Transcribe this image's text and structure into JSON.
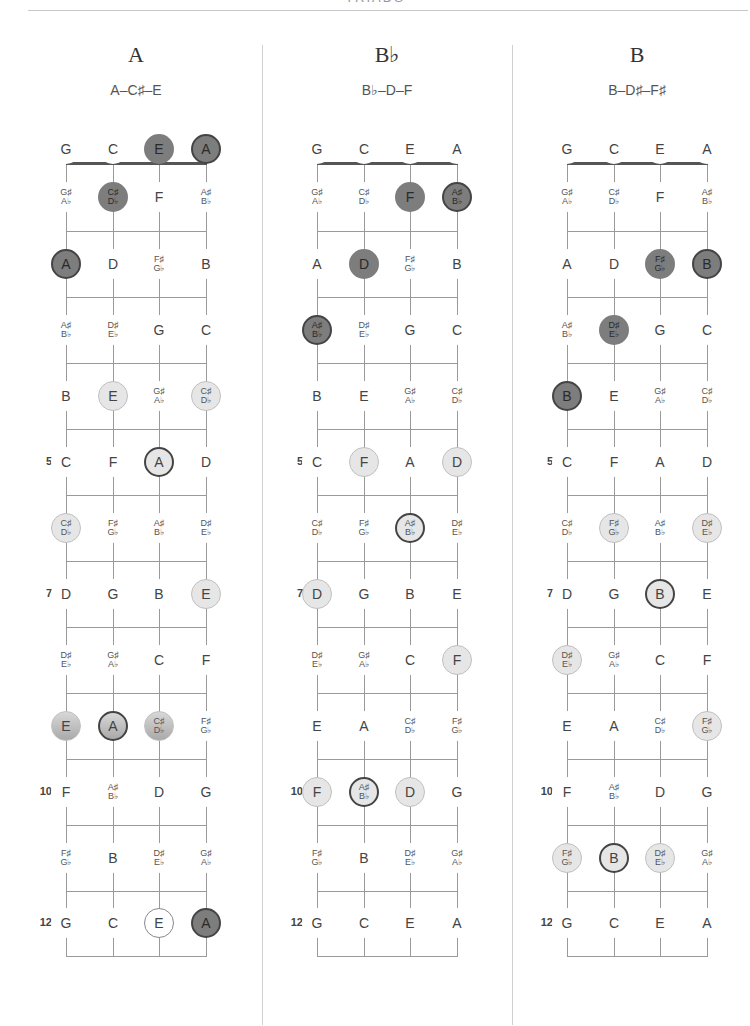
{
  "header": {
    "title": "TRIADS"
  },
  "colors": {
    "dark": "#7d7d7d",
    "mid": "#b8b8b8",
    "light": "#e6e6e6",
    "root_border": "#444444",
    "grid": "#9a9a9a"
  },
  "tuning": [
    "G",
    "C",
    "E",
    "A"
  ],
  "fret_numbers": {
    "5": "5",
    "7": "7",
    "10": "10",
    "12": "12"
  },
  "fretboard_notes": [
    [
      "G",
      "C",
      "E",
      "A"
    ],
    [
      "G♯|A♭",
      "C♯|D♭",
      "F",
      "A♯|B♭"
    ],
    [
      "A",
      "D",
      "F♯|G♭",
      "B"
    ],
    [
      "A♯|B♭",
      "D♯|E♭",
      "G",
      "C"
    ],
    [
      "B",
      "E",
      "G♯|A♭",
      "C♯|D♭"
    ],
    [
      "C",
      "F",
      "A",
      "D"
    ],
    [
      "C♯|D♭",
      "F♯|G♭",
      "A♯|B♭",
      "D♯|E♭"
    ],
    [
      "D",
      "G",
      "B",
      "E"
    ],
    [
      "D♯|E♭",
      "G♯|A♭",
      "C",
      "F"
    ],
    [
      "E",
      "A",
      "C♯|D♭",
      "F♯|G♭"
    ],
    [
      "F",
      "A♯|B♭",
      "D",
      "G"
    ],
    [
      "F♯|G♭",
      "B",
      "D♯|E♭",
      "G♯|A♭"
    ],
    [
      "G",
      "C",
      "E",
      "A"
    ]
  ],
  "chords": [
    {
      "name": "A",
      "notes": "A–C♯–E",
      "highlights": [
        {
          "fret": 0,
          "string": 2,
          "style": "dark",
          "root": false
        },
        {
          "fret": 0,
          "string": 3,
          "style": "dark",
          "root": true
        },
        {
          "fret": 1,
          "string": 1,
          "style": "dark",
          "root": false
        },
        {
          "fret": 2,
          "string": 0,
          "style": "dark",
          "root": true
        },
        {
          "fret": 4,
          "string": 1,
          "style": "light",
          "root": false
        },
        {
          "fret": 4,
          "string": 3,
          "style": "light",
          "root": false
        },
        {
          "fret": 5,
          "string": 2,
          "style": "light",
          "root": true
        },
        {
          "fret": 6,
          "string": 0,
          "style": "light",
          "root": false
        },
        {
          "fret": 7,
          "string": 3,
          "style": "light",
          "root": false
        },
        {
          "fret": 9,
          "string": 0,
          "style": "mid",
          "root": false
        },
        {
          "fret": 9,
          "string": 1,
          "style": "mid",
          "root": true
        },
        {
          "fret": 9,
          "string": 2,
          "style": "mid",
          "root": false
        },
        {
          "fret": 12,
          "string": 2,
          "style": "white",
          "root": false
        },
        {
          "fret": 12,
          "string": 3,
          "style": "dark",
          "root": true
        }
      ]
    },
    {
      "name": "B♭",
      "notes": "B♭–D–F",
      "highlights": [
        {
          "fret": 1,
          "string": 2,
          "style": "dark",
          "root": false
        },
        {
          "fret": 1,
          "string": 3,
          "style": "dark",
          "root": true
        },
        {
          "fret": 2,
          "string": 1,
          "style": "dark",
          "root": false
        },
        {
          "fret": 3,
          "string": 0,
          "style": "dark",
          "root": true
        },
        {
          "fret": 5,
          "string": 1,
          "style": "light",
          "root": false
        },
        {
          "fret": 5,
          "string": 3,
          "style": "light",
          "root": false
        },
        {
          "fret": 6,
          "string": 2,
          "style": "light",
          "root": true
        },
        {
          "fret": 7,
          "string": 0,
          "style": "light",
          "root": false
        },
        {
          "fret": 8,
          "string": 3,
          "style": "light",
          "root": false
        },
        {
          "fret": 10,
          "string": 0,
          "style": "light",
          "root": false
        },
        {
          "fret": 10,
          "string": 1,
          "style": "light",
          "root": true
        },
        {
          "fret": 10,
          "string": 2,
          "style": "light",
          "root": false
        }
      ]
    },
    {
      "name": "B",
      "notes": "B–D♯–F♯",
      "highlights": [
        {
          "fret": 2,
          "string": 2,
          "style": "dark",
          "root": false
        },
        {
          "fret": 2,
          "string": 3,
          "style": "dark",
          "root": true
        },
        {
          "fret": 3,
          "string": 1,
          "style": "dark",
          "root": false
        },
        {
          "fret": 4,
          "string": 0,
          "style": "dark",
          "root": true
        },
        {
          "fret": 6,
          "string": 1,
          "style": "light",
          "root": false
        },
        {
          "fret": 6,
          "string": 3,
          "style": "light",
          "root": false
        },
        {
          "fret": 7,
          "string": 2,
          "style": "light",
          "root": true
        },
        {
          "fret": 8,
          "string": 0,
          "style": "light",
          "root": false
        },
        {
          "fret": 9,
          "string": 3,
          "style": "light",
          "root": false
        },
        {
          "fret": 11,
          "string": 0,
          "style": "light",
          "root": false
        },
        {
          "fret": 11,
          "string": 1,
          "style": "light",
          "root": true
        },
        {
          "fret": 11,
          "string": 2,
          "style": "light",
          "root": false
        }
      ]
    }
  ]
}
